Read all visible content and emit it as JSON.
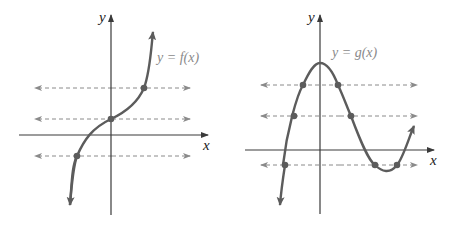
{
  "colors": {
    "axis": "#3a3a3a",
    "curve": "#5c5c5c",
    "dashed": "#8a8a8a",
    "dot": "#5c5c5c",
    "function_label": "#8a8a8a"
  },
  "graphs": [
    {
      "id": "left",
      "function_label": "y = f(x)",
      "x_axis_label": "x",
      "y_axis_label": "y",
      "horizontal_lines": 3,
      "intersections_per_line": [
        1,
        1,
        1
      ],
      "description": "Increasing cubic-like curve; each horizontal line meets graph exactly once (one-to-one)"
    },
    {
      "id": "right",
      "function_label": "y = g(x)",
      "x_axis_label": "x",
      "y_axis_label": "y",
      "horizontal_lines": 3,
      "intersections_per_line": [
        2,
        2,
        3
      ],
      "description": "Cubic with local max on y-axis and local min right of origin; horizontal lines meet graph multiple times (not one-to-one)"
    }
  ]
}
